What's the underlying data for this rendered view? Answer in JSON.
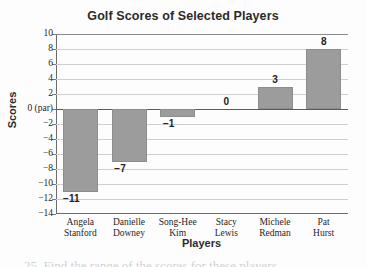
{
  "chart_data": {
    "type": "bar",
    "title": "Golf Scores of Selected Players",
    "xlabel": "Players",
    "ylabel": "Scores",
    "categories": [
      "Angela Stanford",
      "Danielle Downey",
      "Song-Hee Kim",
      "Stacy Lewis",
      "Michele Redman",
      "Pat Hurst"
    ],
    "category_lines": [
      [
        "Angela",
        "Stanford"
      ],
      [
        "Danielle",
        "Downey"
      ],
      [
        "Song-Hee",
        "Kim"
      ],
      [
        "Stacy",
        "Lewis"
      ],
      [
        "Michele",
        "Redman"
      ],
      [
        "Pat",
        "Hurst"
      ]
    ],
    "values": [
      -11,
      -7,
      -1,
      0,
      3,
      8
    ],
    "data_labels": [
      "−11",
      "−7",
      "−1",
      "0",
      "3",
      "8"
    ],
    "ylim": [
      -14,
      10
    ],
    "ytick_step": 2,
    "yticks": [
      10,
      8,
      6,
      4,
      2,
      0,
      -2,
      -4,
      -6,
      -8,
      -10,
      -12,
      -14
    ],
    "ytick_labels": [
      "10",
      "8",
      "6",
      "4",
      "2",
      "0 (par)",
      "−2",
      "−4",
      "−6",
      "−8",
      "−10",
      "−12",
      "−14"
    ],
    "grid": true,
    "legend": "none",
    "bar_color": "#9c9c9c",
    "gridline_color": "#cfcfcf",
    "axis_color": "#6b6b6b",
    "text_color": "#1f1f1f"
  },
  "footer": {
    "clipped_text": "25. Find the range of the scores for these players."
  }
}
